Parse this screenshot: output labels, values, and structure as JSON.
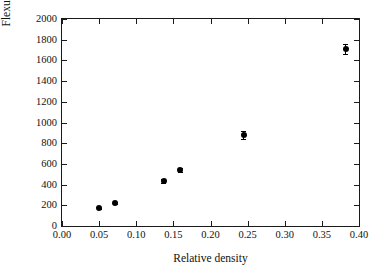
{
  "chart_data": {
    "type": "scatter",
    "title": "",
    "xlabel": "Relative density",
    "ylabel": "Flexural modulus of elasticity (MPa)",
    "xlim": [
      0.0,
      0.4
    ],
    "ylim": [
      0,
      2000
    ],
    "grid": false,
    "legend": null,
    "x_ticks": [
      "0.00",
      "0.05",
      "0.10",
      "0.15",
      "0.20",
      "0.25",
      "0.30",
      "0.35",
      "0.40"
    ],
    "x_tick_values": [
      0.0,
      0.05,
      0.1,
      0.15,
      0.2,
      0.25,
      0.3,
      0.35,
      0.4
    ],
    "y_ticks": [
      "0",
      "200",
      "400",
      "600",
      "800",
      "1000",
      "1200",
      "1400",
      "1600",
      "1800",
      "2000"
    ],
    "y_tick_values": [
      0,
      200,
      400,
      600,
      800,
      1000,
      1200,
      1400,
      1600,
      1800,
      2000
    ],
    "marker_color": "#000000",
    "marker_shape": "circle",
    "series": [
      {
        "name": "Flexural modulus",
        "x": [
          0.05,
          0.072,
          0.137,
          0.159,
          0.245,
          0.382
        ],
        "y": [
          170,
          225,
          435,
          540,
          880,
          1710
        ],
        "yerr": [
          8,
          8,
          20,
          20,
          42,
          45
        ]
      }
    ]
  }
}
